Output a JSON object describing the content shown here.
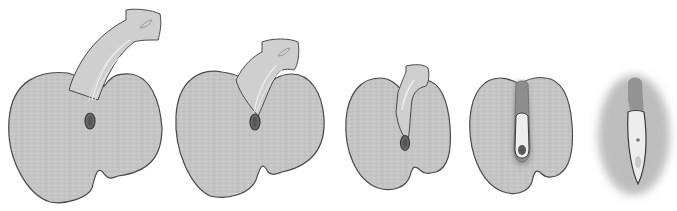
{
  "figure": {
    "type": "illustration-sequence",
    "panel_count": 5,
    "panels": [
      {
        "index": 1,
        "label": "",
        "description": "large lobed body with long curved stalk and leaf-shaped tip"
      },
      {
        "index": 2,
        "label": "",
        "description": "lobed body with shorter curved stalk"
      },
      {
        "index": 3,
        "label": "",
        "description": "smaller body with short stalk"
      },
      {
        "index": 4,
        "label": "",
        "description": "body with embedded elongated structure, darker core"
      },
      {
        "index": 5,
        "label": "",
        "description": "blurred oval body with elongated internal capsule"
      }
    ],
    "colors": {
      "body_fill": "#c4c4c4",
      "outline": "#4a4a4a",
      "stalk_fill": "#cfcfcf",
      "highlight": "#efefef",
      "core_dark": "#5a5a5a",
      "background": "#ffffff"
    }
  }
}
